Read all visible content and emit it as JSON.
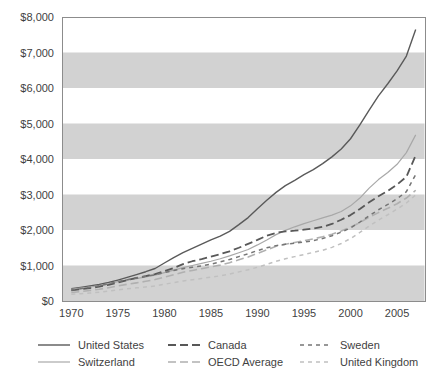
{
  "chart_data": {
    "type": "line",
    "title": "",
    "subtitle": "",
    "xlabel": "",
    "ylabel": "",
    "xlim": [
      1969,
      2008
    ],
    "ylim": [
      0,
      8000
    ],
    "xticks": [
      "1970",
      "1975",
      "1980",
      "1985",
      "1990",
      "1995",
      "2000",
      "2005"
    ],
    "xtick_values": [
      1970,
      1975,
      1980,
      1985,
      1990,
      1995,
      2000,
      2005
    ],
    "yticks": [
      "$0",
      "$1,000",
      "$2,000",
      "$3,000",
      "$4,000",
      "$5,000",
      "$6,000",
      "$7,000",
      "$8,000"
    ],
    "ytick_values": [
      0,
      1000,
      2000,
      3000,
      4000,
      5000,
      6000,
      7000,
      8000
    ],
    "grid": false,
    "banding": true,
    "band_ranges": [
      [
        0,
        1000
      ],
      [
        2000,
        3000
      ],
      [
        4000,
        5000
      ],
      [
        6000,
        7000
      ]
    ],
    "band_color": "#d2d2d2",
    "legend_position": "bottom",
    "legend_columns": 3,
    "x": [
      1970,
      1971,
      1972,
      1973,
      1974,
      1975,
      1976,
      1977,
      1978,
      1979,
      1980,
      1981,
      1982,
      1983,
      1984,
      1985,
      1986,
      1987,
      1988,
      1989,
      1990,
      1991,
      1992,
      1993,
      1994,
      1995,
      1996,
      1997,
      1998,
      1999,
      2000,
      2001,
      2002,
      2003,
      2004,
      2005,
      2006,
      2007
    ],
    "series": [
      {
        "name": "United States",
        "style": "solid",
        "color": "#5a5a5a",
        "width": 1.4,
        "values": [
          350,
          385,
          425,
          465,
          520,
          590,
          665,
          745,
          825,
          915,
          1070,
          1220,
          1360,
          1480,
          1600,
          1720,
          1830,
          1960,
          2150,
          2350,
          2600,
          2840,
          3060,
          3250,
          3400,
          3560,
          3700,
          3870,
          4060,
          4280,
          4570,
          4960,
          5380,
          5780,
          6120,
          6480,
          6900,
          7650
        ]
      },
      {
        "name": "Switzerland",
        "style": "solid",
        "color": "#a8a8a8",
        "width": 1.2,
        "values": [
          330,
          360,
          395,
          435,
          490,
          545,
          590,
          630,
          680,
          730,
          800,
          870,
          940,
          1000,
          1060,
          1120,
          1190,
          1270,
          1360,
          1450,
          1580,
          1720,
          1870,
          1990,
          2090,
          2180,
          2260,
          2340,
          2420,
          2520,
          2680,
          2900,
          3180,
          3420,
          3620,
          3850,
          4180,
          4680
        ]
      },
      {
        "name": "Canada",
        "style": "longdash",
        "color": "#585858",
        "width": 1.8,
        "values": [
          300,
          330,
          365,
          405,
          455,
          520,
          590,
          650,
          700,
          760,
          840,
          930,
          1040,
          1120,
          1180,
          1250,
          1320,
          1400,
          1500,
          1610,
          1720,
          1840,
          1920,
          1960,
          1980,
          2010,
          2040,
          2090,
          2170,
          2290,
          2420,
          2590,
          2780,
          2950,
          3100,
          3280,
          3500,
          4100
        ]
      },
      {
        "name": "OECD Average",
        "style": "longdash",
        "color": "#b0b0b0",
        "width": 1.6,
        "values": [
          240,
          265,
          295,
          330,
          375,
          425,
          470,
          510,
          555,
          605,
          670,
          740,
          810,
          860,
          910,
          960,
          1010,
          1080,
          1160,
          1240,
          1340,
          1440,
          1540,
          1600,
          1650,
          1700,
          1750,
          1810,
          1880,
          1970,
          2080,
          2210,
          2360,
          2490,
          2610,
          2740,
          2900,
          3120
        ]
      },
      {
        "name": "Sweden",
        "style": "shortdash",
        "color": "#757575",
        "width": 1.5,
        "values": [
          310,
          345,
          385,
          430,
          485,
          545,
          600,
          650,
          695,
          740,
          800,
          860,
          910,
          950,
          990,
          1040,
          1100,
          1170,
          1250,
          1330,
          1420,
          1500,
          1560,
          1600,
          1630,
          1660,
          1700,
          1760,
          1840,
          1940,
          2060,
          2220,
          2400,
          2570,
          2720,
          2880,
          3080,
          3560
        ]
      },
      {
        "name": "United Kingdom",
        "style": "shortdash",
        "color": "#c0c0c0",
        "width": 1.5,
        "values": [
          190,
          205,
          225,
          250,
          280,
          315,
          345,
          370,
          395,
          425,
          470,
          520,
          565,
          600,
          635,
          670,
          710,
          760,
          820,
          880,
          950,
          1030,
          1120,
          1190,
          1250,
          1310,
          1370,
          1430,
          1510,
          1620,
          1760,
          1930,
          2110,
          2280,
          2430,
          2590,
          2760,
          2990
        ]
      }
    ]
  },
  "legend": {
    "items": [
      {
        "label": "United States",
        "series": "United States"
      },
      {
        "label": "Canada",
        "series": "Canada"
      },
      {
        "label": "Sweden",
        "series": "Sweden"
      },
      {
        "label": "Switzerland",
        "series": "Switzerland"
      },
      {
        "label": "OECD Average",
        "series": "OECD Average"
      },
      {
        "label": "United Kingdom",
        "series": "United Kingdom"
      }
    ]
  },
  "colors": {
    "band": "#d2d2d2",
    "frame": "#8c8c8c",
    "text": "#3f3f3f",
    "background": "#ffffff"
  }
}
